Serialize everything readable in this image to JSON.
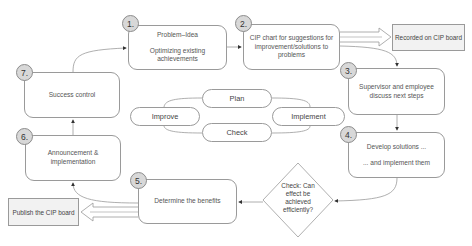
{
  "diagram": {
    "type": "process-flow",
    "steps": [
      {
        "number": "1.",
        "lines": [
          "Problem–Idea",
          "Optimizing existing achievements"
        ]
      },
      {
        "number": "2.",
        "lines": [
          "CIP chart for suggestions for improvement/solutions to problems"
        ]
      },
      {
        "number": "3.",
        "lines": [
          "Supervisor and employee discuss next steps"
        ]
      },
      {
        "number": "4.",
        "lines": [
          "Develop solutions ...",
          "... and implement them"
        ]
      },
      {
        "number": "5.",
        "lines": [
          "Determine the benefits"
        ]
      },
      {
        "number": "6.",
        "lines": [
          "Announcement & implementation"
        ]
      },
      {
        "number": "7.",
        "lines": [
          "Success control"
        ]
      }
    ],
    "decision": {
      "label": "Check: Can effect be achieved efficiently?"
    },
    "outputs": {
      "recorded": "Recorded on CIP board",
      "publish": "Publish the CIP board"
    },
    "cycle": {
      "plan": "Plan",
      "implement": "Implement",
      "check": "Check",
      "improve": "Improve"
    },
    "colors": {
      "stroke": "#9a9a9a",
      "circle_fill": "#d8d8d8",
      "output_fill": "#f2f2f2",
      "text": "#444444"
    }
  }
}
